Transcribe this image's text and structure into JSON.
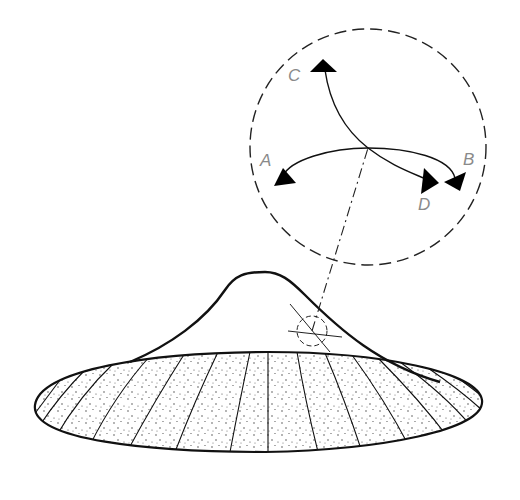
{
  "diagram": {
    "labels": {
      "A": "A",
      "B": "B",
      "C": "C",
      "D": "D"
    },
    "colors": {
      "line": "#111111",
      "label": "#8a8a8a",
      "background": "#ffffff"
    },
    "inset": {
      "shape": "dashed-circle",
      "arrows": [
        "A",
        "B",
        "C",
        "D"
      ]
    },
    "cone": {
      "marker": "dashed-circle-with-crosshair",
      "base": "stippled-ellipse-with-radial-stripes"
    }
  }
}
